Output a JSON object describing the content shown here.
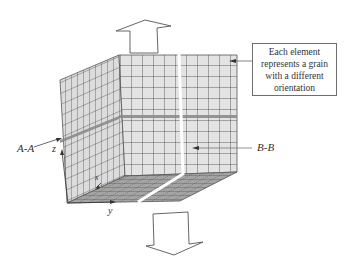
{
  "diagram": {
    "type": "polycrystal-cube-model",
    "callout": {
      "lines": [
        "Each element",
        "represents a grain",
        "with a different",
        "orientation"
      ]
    },
    "sections": {
      "a_a": "A-A",
      "b_b": "B-B"
    },
    "axes": {
      "x": "x",
      "y": "y",
      "z": "z"
    },
    "arrows": {
      "top": "tension-up",
      "bottom": "tension-down"
    },
    "colors": {
      "face": "#e3e3e3",
      "bottom_face": "#9a9a9a",
      "grid": "#3c3c3c",
      "section_band": "#8a8a8a",
      "outline": "#555555"
    }
  }
}
